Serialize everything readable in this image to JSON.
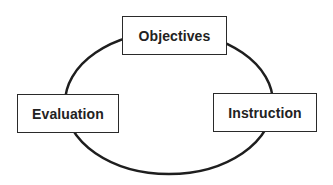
{
  "diagram": {
    "type": "cycle",
    "nodes": [
      {
        "id": "objectives",
        "label": "Objectives",
        "position": "top"
      },
      {
        "id": "instruction",
        "label": "Instruction",
        "position": "right"
      },
      {
        "id": "evaluation",
        "label": "Evaluation",
        "position": "left"
      }
    ],
    "connector": {
      "shape": "ellipse",
      "stroke_color": "#1e1e1e",
      "stroke_width": 2.5
    },
    "colors": {
      "background": "#ffffff",
      "box_border": "#2a2a2a",
      "text": "#222222"
    }
  }
}
